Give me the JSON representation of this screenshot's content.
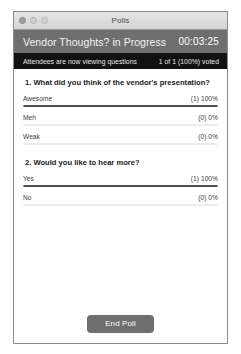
{
  "window": {
    "title": "Polls",
    "traffic_lights": [
      "close-button",
      "minimize-button",
      "zoom-button"
    ]
  },
  "poll_header": {
    "title": "Vendor Thoughts? in Progress",
    "timer": "00:03:25"
  },
  "status_bar": {
    "left_text": "Attendees are now viewing questions",
    "right_text": "1 of 1 (100%) voted"
  },
  "questions": [
    {
      "text": "1. What did you think of the vendor's presentation?",
      "options": [
        {
          "label": "Awesome",
          "result": "(1) 100%",
          "percent": 100
        },
        {
          "label": "Meh",
          "result": "(0) 0%",
          "percent": 0
        },
        {
          "label": "Weak",
          "result": "(0) 0%",
          "percent": 0
        }
      ]
    },
    {
      "text": "2. Would you like to hear more?",
      "options": [
        {
          "label": "Yes",
          "result": "(1) 100%",
          "percent": 100
        },
        {
          "label": "No",
          "result": "(0) 0%",
          "percent": 0
        }
      ]
    }
  ],
  "footer": {
    "end_poll_label": "End Poll"
  },
  "colors": {
    "header_gray": "#6f6f6f",
    "status_black": "#111111",
    "bar_fill": "#4d4d4d",
    "bar_track": "#ececec",
    "button_gray": "#6f6f6f"
  }
}
